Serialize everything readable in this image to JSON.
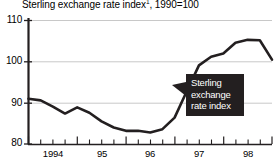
{
  "chart_data": {
    "type": "line",
    "title": "Sterling exchange rate index",
    "title_superscript": "1",
    "title_suffix": ", 1990=100",
    "xlabel": "",
    "ylabel": "",
    "ylim": [
      80,
      110
    ],
    "yticks": [
      80,
      90,
      100,
      110
    ],
    "ytick_labels": [
      "80",
      "90",
      "100",
      "110"
    ],
    "xlim": [
      1993.75,
      1998.75
    ],
    "xtick_labels": [
      "1994",
      "95",
      "96",
      "97",
      "98"
    ],
    "xtick_values": [
      1994,
      1995,
      1996,
      1997,
      1998
    ],
    "minor_ticks_per_year": 4,
    "grid": true,
    "gridlines": [
      90,
      100,
      110
    ],
    "legend": "none",
    "series": [
      {
        "name": "Sterling exchange rate index",
        "color": "#231f20",
        "x": [
          1993.75,
          1994.0,
          1994.25,
          1994.5,
          1994.75,
          1995.0,
          1995.25,
          1995.5,
          1995.75,
          1996.0,
          1996.25,
          1996.5,
          1996.75,
          1997.0,
          1997.25,
          1997.5,
          1997.75,
          1998.0,
          1998.25,
          1998.5,
          1998.75
        ],
        "values": [
          91.0,
          90.6,
          89.1,
          87.4,
          88.9,
          87.6,
          85.5,
          84.0,
          83.2,
          83.2,
          82.8,
          83.6,
          86.4,
          92.8,
          99.1,
          101.2,
          102.0,
          104.6,
          105.3,
          105.2,
          100.5
        ]
      }
    ],
    "annotations": [
      {
        "name": "series-callout",
        "lines": [
          "Sterling",
          "exchange",
          "rate index"
        ],
        "background": "#231f20",
        "text_color": "#ffffff",
        "pointer": "left"
      }
    ]
  },
  "colors": {
    "line": "#231f20",
    "axis": "#231f20",
    "grid": "#c8c8c8",
    "background": "#ffffff",
    "text": "#000000"
  }
}
